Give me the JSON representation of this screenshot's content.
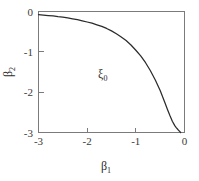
{
  "chart_data": {
    "type": "line",
    "title": "",
    "xlabel": "β₁",
    "ylabel": "β₂",
    "xlabel_base": "β",
    "xlabel_sub": "1",
    "ylabel_base": "β",
    "ylabel_sub": "2",
    "xlim": [
      -3,
      0
    ],
    "ylim": [
      -3,
      0
    ],
    "xticks": [
      -3,
      -2,
      -1,
      0
    ],
    "xticklabels": [
      "-3",
      "-2",
      "-1",
      "0"
    ],
    "yticks": [
      0,
      -1,
      -2,
      -3
    ],
    "yticklabels": [
      "0",
      "-1",
      "-2",
      "-3"
    ],
    "grid": false,
    "legend": "none",
    "frame": "box",
    "series": [
      {
        "name": "boundary-curve",
        "color": "#2b2b2b",
        "x": [
          -3.0,
          -2.9,
          -2.8,
          -2.7,
          -2.6,
          -2.5,
          -2.4,
          -2.3,
          -2.2,
          -2.1,
          -2.0,
          -1.9,
          -1.8,
          -1.7,
          -1.6,
          -1.5,
          -1.4,
          -1.3,
          -1.2,
          -1.1,
          -1.0,
          -0.9,
          -0.8,
          -0.7,
          -0.6,
          -0.5,
          -0.4,
          -0.35,
          -0.3,
          -0.25,
          -0.2,
          -0.17,
          -0.14,
          -0.12,
          -0.1,
          -0.09,
          -0.08
        ],
        "y": [
          -0.08,
          -0.09,
          -0.1,
          -0.11,
          -0.13,
          -0.14,
          -0.16,
          -0.18,
          -0.2,
          -0.23,
          -0.26,
          -0.29,
          -0.33,
          -0.37,
          -0.42,
          -0.48,
          -0.55,
          -0.63,
          -0.72,
          -0.83,
          -0.96,
          -1.1,
          -1.27,
          -1.47,
          -1.7,
          -1.96,
          -2.27,
          -2.43,
          -2.58,
          -2.72,
          -2.83,
          -2.88,
          -2.92,
          -2.95,
          -2.97,
          -2.985,
          -3.0
        ]
      }
    ],
    "annotations": [
      {
        "name": "region-label-xi0",
        "base": "ξ",
        "sub": "0",
        "x": -1.68,
        "y": -1.66
      }
    ]
  },
  "axes": {
    "x_axis_name": "beta-1-axis",
    "y_axis_name": "beta-2-axis"
  }
}
